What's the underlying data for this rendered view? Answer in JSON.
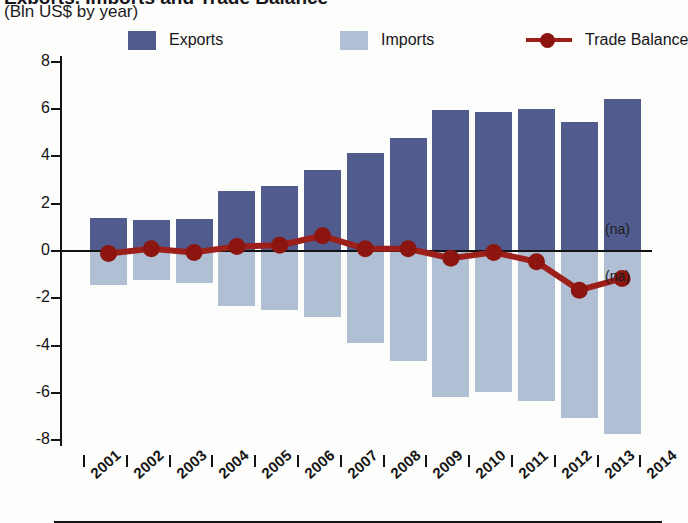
{
  "header": {
    "title": "Exports, Imports and Trade Balance",
    "subtitle": "(Bln US$ by year)"
  },
  "legend": {
    "position": "top",
    "items": [
      {
        "label": "Exports",
        "type": "swatch",
        "color": "#515b8d",
        "icon": "square-swatch-icon"
      },
      {
        "label": "Imports",
        "type": "swatch",
        "color": "#b0bfd4",
        "icon": "square-swatch-icon"
      },
      {
        "label": "Trade Balance",
        "type": "line-marker",
        "color": "#9c1f1a",
        "icon": "line-marker-icon"
      }
    ]
  },
  "axes": {
    "y": {
      "label": "",
      "ticks": [
        8,
        6,
        4,
        2,
        0,
        -2,
        -4,
        -6,
        -8
      ],
      "tick_labels": [
        "8",
        "6",
        "4",
        "2",
        "0",
        "-2",
        "-4",
        "-6",
        "-8"
      ],
      "limits": [
        -8,
        8
      ]
    },
    "x": {
      "label": "",
      "tick_labels": [
        "2001",
        "2002",
        "2003",
        "2004",
        "2005",
        "2006",
        "2007",
        "2008",
        "2009",
        "2010",
        "2011",
        "2012",
        "2013",
        "2014"
      ]
    }
  },
  "annotations": [
    {
      "name": "na-exports",
      "text": "(na)",
      "value": 0.85
    },
    {
      "name": "na-imports",
      "text": "(na)",
      "value": -1.15
    }
  ],
  "chart_data": {
    "type": "bar",
    "title": "Exports, Imports and Trade Balance",
    "subtitle": "(Bln US$ by year)",
    "xlabel": "",
    "ylabel": "Bln US$",
    "ylim": [
      -8,
      8
    ],
    "ytick_step": 2,
    "grid": false,
    "legend_position": "top",
    "categories": [
      "2001",
      "2002",
      "2003",
      "2004",
      "2005",
      "2006",
      "2007",
      "2008",
      "2009",
      "2010",
      "2011",
      "2012",
      "2013"
    ],
    "series": [
      {
        "name": "Exports",
        "color": "#515b8d",
        "type": "bar",
        "values": [
          1.35,
          1.25,
          1.3,
          2.5,
          2.7,
          3.4,
          4.1,
          4.75,
          5.9,
          5.85,
          5.95,
          5.4,
          6.4
        ]
      },
      {
        "name": "Imports",
        "color": "#b0bfd4",
        "type": "bar",
        "values": [
          -1.5,
          -1.25,
          -1.4,
          -2.35,
          -2.55,
          -2.85,
          -3.95,
          -4.7,
          -6.2,
          -6.0,
          -6.4,
          -7.1,
          -7.8
        ]
      },
      {
        "name": "Trade Balance",
        "color": "#9c1f1a",
        "type": "line",
        "values": [
          -0.15,
          0.05,
          -0.1,
          0.15,
          0.2,
          0.6,
          0.05,
          0.05,
          -0.35,
          -0.1,
          -0.5,
          -1.7,
          -1.2
        ]
      }
    ]
  }
}
